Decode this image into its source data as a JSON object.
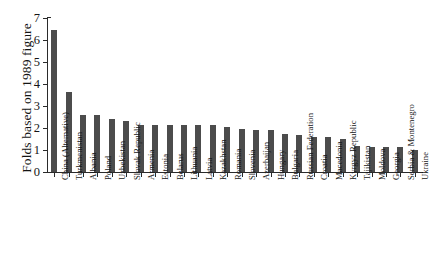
{
  "chart_data": {
    "type": "bar",
    "title": "",
    "subtitle": "",
    "xlabel": "",
    "ylabel": "Folds based on 1989 figure",
    "ylim": [
      0,
      7
    ],
    "ytick_values": [
      0,
      1,
      2,
      3,
      4,
      5,
      6,
      7
    ],
    "ytick_labels": [
      "0",
      "1",
      "2",
      "3",
      "4",
      "5",
      "6",
      "7"
    ],
    "grid": false,
    "legend": null,
    "bar_color": "#4c4c4c",
    "axis_color": "#2b2b2b",
    "background_color": "#ffffff",
    "categories": [
      "China (Alternative)",
      "Turkmenistan",
      "Albania",
      "Poland",
      "Uzbekistan",
      "Slovak Republic",
      "Armenia",
      "Estonia",
      "Belarus",
      "Lithuania",
      "Latvia",
      "Kazakhstan",
      "Romania",
      "Slovenia",
      "Azerbaijan",
      "Hungary",
      "Bulgaria",
      "Russian Federation",
      "Croatia",
      "Macedonia",
      "Kyrgyz Republic",
      "Tajikistan",
      "Moldova",
      "Georgia",
      "Serbia & Montenegro",
      "Ukraine"
    ],
    "values": [
      6.45,
      3.65,
      2.6,
      2.58,
      2.4,
      2.3,
      2.15,
      2.15,
      2.15,
      2.15,
      2.15,
      2.12,
      2.05,
      1.95,
      1.92,
      1.9,
      1.75,
      1.68,
      1.6,
      1.6,
      1.48,
      1.2,
      1.15,
      1.15,
      1.12,
      1.0
    ]
  }
}
